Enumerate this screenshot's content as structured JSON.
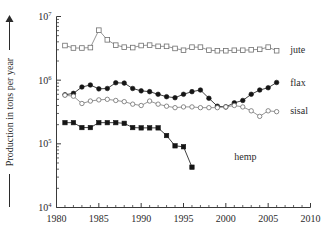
{
  "chart_data": {
    "type": "line",
    "title": "",
    "xlabel": "",
    "ylabel": "Production in tons per year",
    "ylabel_prefix": "——",
    "ylabel_suffix_arrow": "▲",
    "xlim": [
      1980,
      2010
    ],
    "ylim": [
      10000,
      10000000
    ],
    "yscale": "log",
    "xticks": [
      1980,
      1985,
      1990,
      1995,
      2000,
      2005,
      2010
    ],
    "xticklabels": [
      "1980",
      "1985",
      "1990",
      "1995",
      "2000",
      "2005",
      "2010"
    ],
    "xminor_step": 1,
    "yticks": [
      10000,
      100000,
      1000000,
      10000000
    ],
    "yticklabels": [
      "10⁴",
      "10⁵",
      "10⁶",
      "10⁷"
    ],
    "ytick_bases": [
      "10",
      "10",
      "10",
      "10"
    ],
    "ytick_exponents": [
      "4",
      "5",
      "6",
      "7"
    ],
    "grid": false,
    "legend_position": "right-inline",
    "series": [
      {
        "name": "jute",
        "label": "jute",
        "marker": "open-square",
        "color": "#8a8a8a",
        "x": [
          1981,
          1982,
          1983,
          1984,
          1985,
          1986,
          1987,
          1988,
          1989,
          1990,
          1991,
          1992,
          1993,
          1994,
          1995,
          1996,
          1997,
          1998,
          1999,
          2000,
          2001,
          2002,
          2003,
          2004,
          2005,
          2006
        ],
        "values": [
          3500000,
          3200000,
          3200000,
          3250000,
          6100000,
          4300000,
          3550000,
          3300000,
          3250000,
          3500000,
          3550000,
          3400000,
          3400000,
          3150000,
          2950000,
          3300000,
          3300000,
          2950000,
          2900000,
          2900000,
          2950000,
          2950000,
          3000000,
          3050000,
          3300000,
          2900000
        ]
      },
      {
        "name": "flax",
        "label": "flax",
        "marker": "filled-circle",
        "color": "#151515",
        "x": [
          1981,
          1982,
          1983,
          1984,
          1985,
          1986,
          1987,
          1988,
          1989,
          1990,
          1991,
          1992,
          1993,
          1994,
          1995,
          1996,
          1997,
          1998,
          1999,
          2000,
          2001,
          2002,
          2003,
          2004,
          2005,
          2006
        ],
        "values": [
          590000,
          620000,
          780000,
          840000,
          730000,
          740000,
          910000,
          900000,
          740000,
          680000,
          660000,
          600000,
          550000,
          530000,
          600000,
          660000,
          700000,
          520000,
          390000,
          380000,
          440000,
          480000,
          600000,
          700000,
          760000,
          920000
        ]
      },
      {
        "name": "sisal",
        "label": "sisal",
        "marker": "open-circle",
        "color": "#8a8a8a",
        "x": [
          1981,
          1982,
          1983,
          1984,
          1985,
          1986,
          1987,
          1988,
          1989,
          1990,
          1991,
          1992,
          1993,
          1994,
          1995,
          1996,
          1997,
          1998,
          1999,
          2000,
          2001,
          2002,
          2003,
          2004,
          2005,
          2006
        ],
        "values": [
          580000,
          560000,
          430000,
          470000,
          490000,
          500000,
          480000,
          460000,
          420000,
          400000,
          470000,
          420000,
          390000,
          370000,
          380000,
          380000,
          370000,
          370000,
          370000,
          380000,
          400000,
          380000,
          330000,
          270000,
          330000,
          320000
        ]
      },
      {
        "name": "hemp",
        "label": "hemp",
        "marker": "filled-square",
        "color": "#151515",
        "x": [
          1981,
          1982,
          1983,
          1984,
          1985,
          1986,
          1987,
          1988,
          1989,
          1990,
          1991,
          1992,
          1993,
          1994,
          1995,
          1996
        ],
        "values": [
          215000,
          215000,
          180000,
          180000,
          215000,
          215000,
          215000,
          210000,
          180000,
          178000,
          178000,
          178000,
          135000,
          93000,
          90000,
          43000
        ]
      }
    ],
    "series_label_positions": [
      {
        "name": "jute",
        "x": 2007.6,
        "y": 3000000
      },
      {
        "name": "flax",
        "x": 2007.6,
        "y": 930000
      },
      {
        "name": "sisal",
        "x": 2007.6,
        "y": 335000
      },
      {
        "name": "hemp",
        "x": 2001.0,
        "y": 64000
      }
    ]
  }
}
